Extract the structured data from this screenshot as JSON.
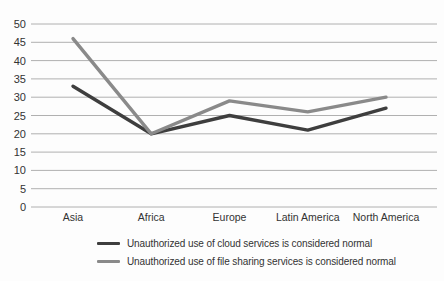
{
  "chart_data": {
    "type": "line",
    "title": "",
    "categories": [
      "Asia",
      "Africa",
      "Europe",
      "Latin America",
      "North America"
    ],
    "series": [
      {
        "name": "Unauthorized use of cloud services is considered normal",
        "values": [
          33,
          20,
          25,
          21,
          27
        ],
        "color": "#3e3e3e"
      },
      {
        "name": "Unauthorized use of file sharing services is considered normal",
        "values": [
          46,
          20,
          29,
          26,
          30
        ],
        "color": "#8a8a8a"
      }
    ],
    "ylim": [
      0,
      50
    ],
    "y_ticks": [
      0,
      5,
      10,
      15,
      20,
      25,
      30,
      35,
      40,
      45,
      50
    ],
    "grid": true,
    "grid_color": "#b0b0b0",
    "text_color": "#333333",
    "legend_position": "bottom"
  }
}
